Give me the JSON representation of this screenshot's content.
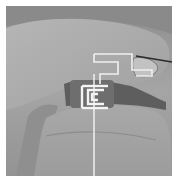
{
  "image": {
    "description": "Grayscale photograph of fingers holding a small metal bracket with a thin wire",
    "colors": {
      "border": "#ffffff",
      "background_skin": "#9a9a9a",
      "highlight_skin": "#b8b8b8",
      "shadow": "#5a5a5a",
      "metal": "#f2f2f2",
      "wire_dark": "#2a2a2a"
    }
  }
}
